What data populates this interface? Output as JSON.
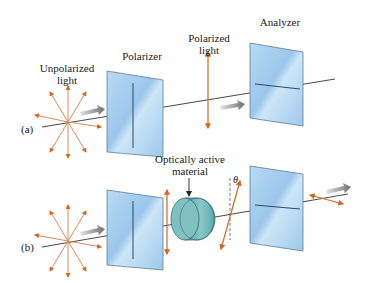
{
  "figure": {
    "colors": {
      "arrow_orange": "#d9651f",
      "plate_blue": "#a9cfee",
      "plate_edge": "#5c7d99",
      "cylinder": "#6fb3b6",
      "beam": "#333333",
      "gray_arrow": "#8a8a8a"
    }
  },
  "panel_a": {
    "tag": "(a)",
    "labels": {
      "unpolarized_line1": "Unpolarized",
      "unpolarized_line2": "light",
      "polarizer": "Polarizer",
      "polarized_line1": "Polarized",
      "polarized_line2": "light",
      "analyzer": "Analyzer"
    }
  },
  "panel_b": {
    "tag": "(b)",
    "labels": {
      "material_line1": "Optically active",
      "material_line2": "material",
      "angle": "θ"
    }
  }
}
